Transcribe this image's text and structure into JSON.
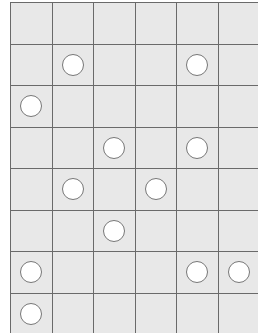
{
  "board": {
    "rows": 8,
    "cols": 6,
    "colors": {
      "cell": "#e8e8e8",
      "line": "#6a6a6a",
      "stone_fill": "#ffffff",
      "stone_border": "#777777"
    },
    "stones": [
      [
        1,
        1
      ],
      [
        1,
        4
      ],
      [
        2,
        0
      ],
      [
        3,
        2
      ],
      [
        3,
        4
      ],
      [
        4,
        1
      ],
      [
        4,
        3
      ],
      [
        5,
        2
      ],
      [
        6,
        0
      ],
      [
        6,
        4
      ],
      [
        6,
        5
      ],
      [
        7,
        0
      ]
    ]
  }
}
